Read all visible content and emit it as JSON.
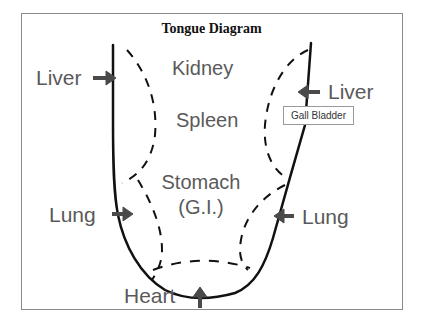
{
  "title": "Tongue Diagram",
  "zones": {
    "kidney": "Kidney",
    "spleen": "Spleen",
    "stomach_line1": "Stomach",
    "stomach_line2": "(G.I.)"
  },
  "pointers": {
    "liver_left": "Liver",
    "liver_right": "Liver",
    "lung_left": "Lung",
    "lung_right": "Lung",
    "heart": "Heart"
  },
  "callout": {
    "gall_bladder": "Gall Bladder"
  },
  "colors": {
    "outline": "#111111",
    "label_text": "#5a5a5a",
    "arrow": "#4a4a4a",
    "frame_border": "#8a8a8a"
  }
}
